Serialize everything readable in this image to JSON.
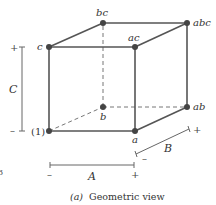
{
  "diagram": {
    "caption_prefix": "(a)",
    "caption_text": "Geometric view",
    "colors": {
      "edge": "#555555",
      "dashed": "#777777",
      "vertex": "#444444",
      "axis": "#666666",
      "text": "#333333"
    },
    "vertices": {
      "one": {
        "label": "(1)",
        "x": 49,
        "y": 131
      },
      "a": {
        "label": "a",
        "x": 135,
        "y": 131
      },
      "b": {
        "label": "b",
        "x": 103,
        "y": 107
      },
      "ab": {
        "label": "ab",
        "x": 187,
        "y": 107
      },
      "c": {
        "label": "c",
        "x": 49,
        "y": 47
      },
      "ac": {
        "label": "ac",
        "x": 135,
        "y": 47
      },
      "bc": {
        "label": "bc",
        "x": 103,
        "y": 23
      },
      "abc": {
        "label": "abc",
        "x": 187,
        "y": 23
      }
    },
    "axes": {
      "A": {
        "label": "A",
        "minus": "–",
        "plus": "+"
      },
      "B": {
        "label": "B",
        "minus": "–",
        "plus": "+"
      },
      "C": {
        "label": "C",
        "minus": "–",
        "plus": "+"
      }
    },
    "stray_mark": "3"
  }
}
